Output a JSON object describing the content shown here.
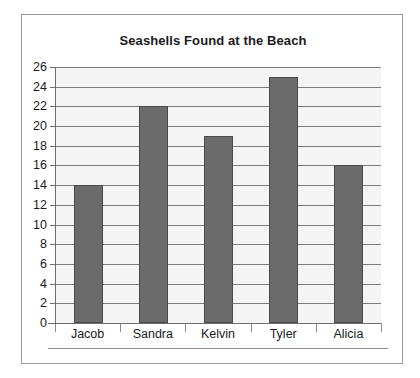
{
  "chart_data": {
    "type": "bar",
    "title": "Seashells Found at the Beach",
    "xlabel": "",
    "ylabel": "",
    "categories": [
      "Jacob",
      "Sandra",
      "Kelvin",
      "Tyler",
      "Alicia"
    ],
    "values": [
      14,
      22,
      19,
      25,
      16
    ],
    "series": [
      {
        "name": "Seashells Found",
        "values": [
          14,
          22,
          19,
          25,
          16
        ]
      }
    ],
    "ylim": [
      0,
      26
    ],
    "ytick_step": 2,
    "ytick_labels": [
      "26",
      "24",
      "22",
      "20",
      "18",
      "16",
      "14",
      "12",
      "10",
      "8",
      "6",
      "4",
      "2",
      "0"
    ],
    "ytick_values": [
      26,
      24,
      22,
      20,
      18,
      16,
      14,
      12,
      10,
      8,
      6,
      4,
      2,
      0
    ],
    "grid": true,
    "grid_axis": "y",
    "legend": false,
    "legend_position": "none",
    "colors": {
      "bar_fill": "#6b6b6b",
      "bar_border": "#4a4a4a",
      "plot_background": "#f4f4f4",
      "gridline": "#7d7d7d",
      "axis": "#6e6e6e",
      "frame_border": "#9a9a9a",
      "text": "#1a1a1a",
      "page_background": "#ffffff"
    }
  }
}
